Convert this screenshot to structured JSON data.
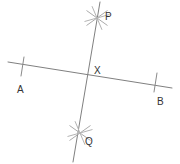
{
  "figure": {
    "type": "geometric-construction",
    "width": 180,
    "height": 164,
    "background_color": "#ffffff",
    "line_color": "#808080",
    "arc_color": "#9a9a9a",
    "label_color": "#333333",
    "label_font_size": 10
  },
  "labels": {
    "p": "P",
    "q": "Q",
    "a": "A",
    "b": "B",
    "x": "X"
  },
  "points": {
    "P": {
      "label": "P",
      "x": 97,
      "y": 18,
      "label_x": 105,
      "label_y": 12
    },
    "Q": {
      "label": "Q",
      "x": 80,
      "y": 133,
      "label_x": 85,
      "label_y": 137
    },
    "A": {
      "label": "A",
      "x": 22,
      "y": 66,
      "label_x": 17,
      "label_y": 85
    },
    "B": {
      "label": "B",
      "x": 155,
      "y": 84,
      "label_x": 157,
      "label_y": 97
    },
    "X": {
      "label": "X",
      "x": 88,
      "y": 76,
      "label_x": 94,
      "label_y": 66
    }
  },
  "segments": [
    {
      "name": "line-ab",
      "from": "A-end",
      "to": "B-end",
      "x1": 8,
      "y1": 62,
      "x2": 172,
      "y2": 88,
      "color": "#808080",
      "width": 1
    },
    {
      "name": "line-pq",
      "from": "P-end",
      "to": "Q-end",
      "x1": 100,
      "y1": 2,
      "x2": 73,
      "y2": 162,
      "color": "#808080",
      "width": 1
    }
  ],
  "tick_marks": [
    {
      "name": "tick-near-a",
      "x1": 24,
      "y1": 57,
      "x2": 21,
      "y2": 76,
      "color": "#8a8a8a"
    },
    {
      "name": "tick-near-b",
      "x1": 157,
      "y1": 73,
      "x2": 154,
      "y2": 92,
      "color": "#8a8a8a"
    }
  ],
  "arc_crosses": [
    {
      "name": "arc-cross-p",
      "center_x": 97,
      "center_y": 18,
      "radius": 13,
      "color": "#a8a8a8",
      "strokes": [
        {
          "angle": 22
        },
        {
          "angle": 68
        },
        {
          "angle": 112
        },
        {
          "angle": 158
        }
      ]
    },
    {
      "name": "arc-cross-q",
      "center_x": 80,
      "center_y": 133,
      "radius": 13,
      "color": "#a8a8a8",
      "strokes": [
        {
          "angle": 22
        },
        {
          "angle": 68
        },
        {
          "angle": 112
        },
        {
          "angle": 158
        }
      ]
    }
  ]
}
